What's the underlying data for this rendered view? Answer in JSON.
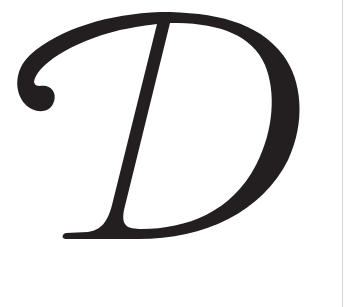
{
  "image": {
    "letter": "D",
    "style": "italic serif capital letter",
    "colors": {
      "glyph": "#231f20",
      "background": "#ffffff",
      "edge_line": "#d4d4d4"
    }
  }
}
